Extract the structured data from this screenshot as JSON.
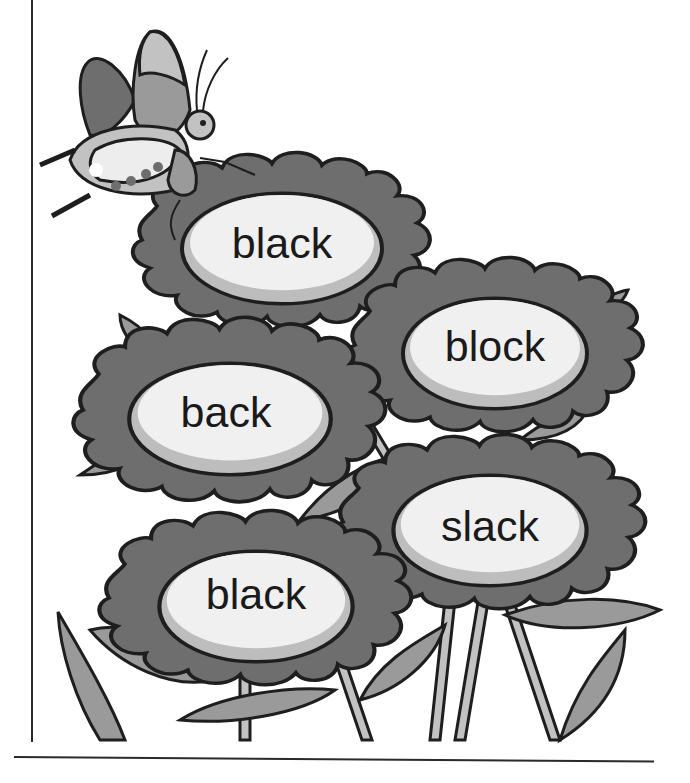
{
  "worksheet": {
    "illustration": "butterfly-over-flowers",
    "flowers": [
      {
        "word": "black",
        "cx": 282,
        "cy": 243
      },
      {
        "word": "block",
        "cx": 495,
        "cy": 346
      },
      {
        "word": "back",
        "cx": 226,
        "cy": 410
      },
      {
        "word": "slack",
        "cx": 490,
        "cy": 523
      },
      {
        "word": "black",
        "cx": 256,
        "cy": 595
      }
    ]
  },
  "colors": {
    "petal": "#6e6e6e",
    "petal_light": "#8a8a8a",
    "oval": "#f0f0f0",
    "oval_shadow": "#bdbdbd",
    "leaf": "#9a9a9a",
    "stem": "#c2c2c2",
    "outline": "#1e1e1e"
  }
}
